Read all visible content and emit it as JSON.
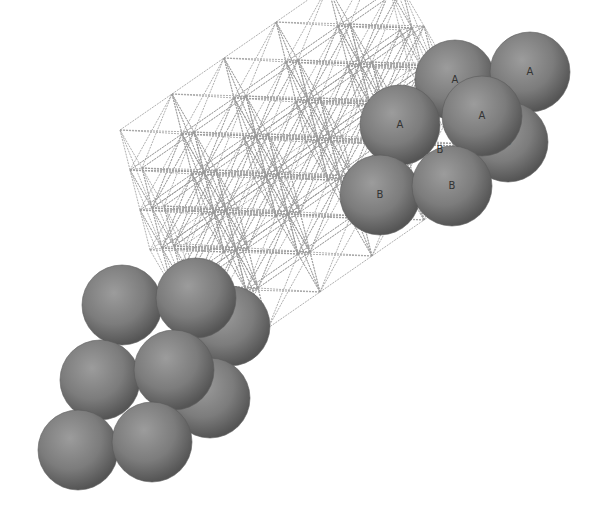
{
  "diagram": {
    "colors": {
      "background": "#ffffff",
      "sphere_fill": "#7a7a7a",
      "sphere_dark": "#4a4a4a",
      "sphere_light": "#9a9a9a",
      "wire": "#9a9a9a",
      "label": "#333333"
    },
    "sphere_radius": 40,
    "clusters": [
      {
        "name": "top-right",
        "spheres": [
          {
            "x": 455,
            "y": 80,
            "label": "A"
          },
          {
            "x": 530,
            "y": 72,
            "label": "A"
          },
          {
            "x": 508,
            "y": 142,
            "label": "B"
          },
          {
            "x": 400,
            "y": 125,
            "label": "A"
          },
          {
            "x": 482,
            "y": 116,
            "label": "A"
          },
          {
            "x": 380,
            "y": 195,
            "label": "B"
          },
          {
            "x": 452,
            "y": 186,
            "label": "B"
          }
        ],
        "extra_labels": [
          {
            "x": 440,
            "y": 150,
            "label": "B"
          }
        ]
      },
      {
        "name": "bottom-left",
        "spheres": [
          {
            "x": 230,
            "y": 326,
            "label": ""
          },
          {
            "x": 210,
            "y": 398,
            "label": ""
          },
          {
            "x": 122,
            "y": 305,
            "label": ""
          },
          {
            "x": 196,
            "y": 298,
            "label": ""
          },
          {
            "x": 100,
            "y": 380,
            "label": ""
          },
          {
            "x": 174,
            "y": 370,
            "label": ""
          },
          {
            "x": 78,
            "y": 450,
            "label": ""
          },
          {
            "x": 152,
            "y": 442,
            "label": ""
          }
        ],
        "extra_labels": []
      }
    ]
  }
}
